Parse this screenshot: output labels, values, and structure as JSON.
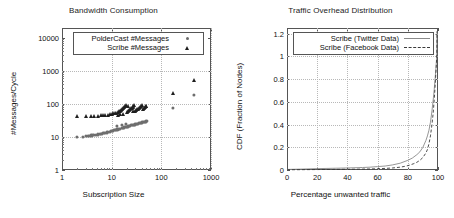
{
  "figure": {
    "panels": [
      "bandwidth-consumption",
      "traffic-overhead-distribution"
    ]
  },
  "chart_data": [
    {
      "type": "scatter",
      "id": "bandwidth-consumption",
      "title": "Bandwidth Consumption",
      "xlabel": "Subscription Size",
      "ylabel": "#Messages/Cycle",
      "xscale": "log",
      "yscale": "log",
      "xlim": [
        1,
        1000
      ],
      "ylim": [
        1,
        20000
      ],
      "xticks": [
        1,
        10,
        100,
        1000
      ],
      "xticklabels": [
        "1",
        "10",
        "100",
        "1000"
      ],
      "yticks": [
        1,
        10,
        100,
        1000,
        10000
      ],
      "yticklabels": [
        "1",
        "10",
        "100",
        "1000",
        "10000"
      ],
      "grid": true,
      "legend_position": "top-left-inside",
      "series": [
        {
          "name": "PolderCast #Messages",
          "marker": "circle",
          "color": "#6e6e6e",
          "points": [
            [
              2,
              10
            ],
            [
              2.6,
              10.3
            ],
            [
              3,
              10.6
            ],
            [
              3.4,
              11
            ],
            [
              3.9,
              11.2
            ],
            [
              4.3,
              11.4
            ],
            [
              4.8,
              11.8
            ],
            [
              5.2,
              12
            ],
            [
              5.7,
              12.3
            ],
            [
              6.2,
              12.6
            ],
            [
              6.8,
              13
            ],
            [
              7.3,
              13.4
            ],
            [
              7.9,
              13.8
            ],
            [
              8.5,
              14.2
            ],
            [
              9.2,
              14.6
            ],
            [
              9.9,
              15
            ],
            [
              10.6,
              15.5
            ],
            [
              11.4,
              16
            ],
            [
              12.2,
              16.4
            ],
            [
              13,
              16.9
            ],
            [
              13.9,
              17.4
            ],
            [
              14.8,
              18
            ],
            [
              15.8,
              18.5
            ],
            [
              16.8,
              19
            ],
            [
              17.8,
              19.6
            ],
            [
              18.9,
              20
            ],
            [
              20,
              20.6
            ],
            [
              21.2,
              21
            ],
            [
              22.4,
              21.6
            ],
            [
              23.7,
              22
            ],
            [
              25,
              22.6
            ],
            [
              26.4,
              23
            ],
            [
              27.8,
              23.6
            ],
            [
              29.3,
              24
            ],
            [
              30.8,
              24.5
            ],
            [
              32.4,
              25
            ],
            [
              34,
              25.6
            ],
            [
              35.7,
              26
            ],
            [
              37.4,
              26.6
            ],
            [
              39.2,
              27
            ],
            [
              41,
              27.6
            ],
            [
              43,
              28
            ],
            [
              45,
              28.6
            ],
            [
              47,
              29
            ],
            [
              49,
              29.5
            ],
            [
              51,
              30
            ],
            [
              12.8,
              21.5
            ],
            [
              16.2,
              23.5
            ],
            [
              19.5,
              25
            ],
            [
              170,
              75
            ],
            [
              450,
              190
            ]
          ]
        },
        {
          "name": "Scribe #Messages",
          "marker": "triangle",
          "color": "#1f1f1f",
          "points": [
            [
              2,
              42
            ],
            [
              3,
              42
            ],
            [
              3.8,
              42
            ],
            [
              4.5,
              43
            ],
            [
              5.2,
              44
            ],
            [
              6,
              45
            ],
            [
              6.8,
              45
            ],
            [
              7.5,
              46
            ],
            [
              8.3,
              47
            ],
            [
              9.1,
              48
            ],
            [
              10,
              50
            ],
            [
              10.8,
              52
            ],
            [
              11.6,
              53
            ],
            [
              12.4,
              55
            ],
            [
              13.2,
              57
            ],
            [
              14,
              60
            ],
            [
              14.8,
              63
            ],
            [
              15.6,
              66
            ],
            [
              16.4,
              70
            ],
            [
              17.2,
              75
            ],
            [
              18,
              80
            ],
            [
              18.8,
              86
            ],
            [
              19.6,
              92
            ],
            [
              20.5,
              58
            ],
            [
              21.5,
              62
            ],
            [
              22.5,
              66
            ],
            [
              23.5,
              70
            ],
            [
              24.5,
              74
            ],
            [
              25.5,
              78
            ],
            [
              26.5,
              83
            ],
            [
              27.5,
              88
            ],
            [
              28.5,
              94
            ],
            [
              29.5,
              60
            ],
            [
              31,
              64
            ],
            [
              32.5,
              68
            ],
            [
              34,
              72
            ],
            [
              35.5,
              76
            ],
            [
              37,
              80
            ],
            [
              38.5,
              85
            ],
            [
              40,
              90
            ],
            [
              42,
              72
            ],
            [
              44,
              76
            ],
            [
              46,
              80
            ],
            [
              48,
              84
            ],
            [
              50,
              88
            ],
            [
              13.5,
              46
            ],
            [
              15,
              49
            ],
            [
              16.8,
              51
            ],
            [
              21,
              88
            ],
            [
              27,
              62
            ],
            [
              170,
              220
            ],
            [
              450,
              530
            ]
          ]
        }
      ]
    },
    {
      "type": "line",
      "id": "traffic-overhead-distribution",
      "title": "Traffic Overhead Distribution",
      "xlabel": "Percentage unwanted traffic",
      "ylabel": "CDF (Fraction of Nodes)",
      "xscale": "linear",
      "yscale": "linear",
      "xlim": [
        0,
        100
      ],
      "ylim": [
        0,
        1.25
      ],
      "xticks": [
        0,
        20,
        40,
        60,
        80,
        100
      ],
      "xticklabels": [
        "0",
        "20",
        "40",
        "60",
        "80",
        "100"
      ],
      "yticks": [
        0,
        0.2,
        0.4,
        0.6,
        0.8,
        1,
        1.2
      ],
      "yticklabels": [
        "0",
        "0.2",
        "0.4",
        "0.6",
        "0.8",
        "1",
        "1.2"
      ],
      "grid": true,
      "legend_position": "top-center-inside",
      "series": [
        {
          "name": "Scribe (Twitter Data)",
          "style": "solid",
          "color": "#8a8a8a",
          "x": [
            0,
            10,
            20,
            30,
            40,
            50,
            55,
            60,
            65,
            70,
            75,
            80,
            83,
            86,
            88,
            90,
            92,
            93,
            94,
            95,
            96,
            97,
            97.5,
            98,
            98.3,
            98.6,
            98.8,
            99,
            99.2
          ],
          "y": [
            0.005,
            0.008,
            0.012,
            0.015,
            0.018,
            0.022,
            0.025,
            0.03,
            0.035,
            0.045,
            0.06,
            0.085,
            0.105,
            0.135,
            0.16,
            0.2,
            0.26,
            0.3,
            0.35,
            0.42,
            0.52,
            0.64,
            0.71,
            0.79,
            0.84,
            0.89,
            0.93,
            0.97,
            1.0
          ]
        },
        {
          "name": "Scribe (Facebook Data)",
          "style": "dashed",
          "color": "#3a3a3a",
          "x": [
            0,
            10,
            20,
            30,
            40,
            50,
            55,
            60,
            65,
            70,
            75,
            78,
            81,
            84,
            86,
            88,
            90,
            92,
            93,
            94,
            95,
            96,
            96.8,
            97.5,
            98,
            98.4,
            98.7,
            99,
            99.2
          ],
          "y": [
            0.002,
            0.003,
            0.004,
            0.005,
            0.006,
            0.008,
            0.009,
            0.011,
            0.014,
            0.018,
            0.025,
            0.032,
            0.042,
            0.056,
            0.068,
            0.085,
            0.11,
            0.15,
            0.18,
            0.23,
            0.3,
            0.4,
            0.5,
            0.62,
            0.72,
            0.81,
            0.88,
            0.95,
            1.0
          ]
        }
      ]
    }
  ]
}
